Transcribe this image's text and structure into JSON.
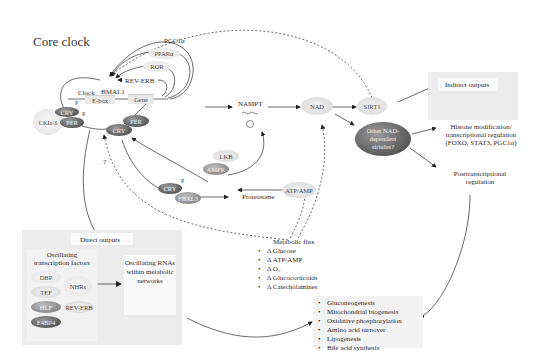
{
  "title": "Core clock",
  "core_clock": {
    "regulators": [
      "PGC1α",
      "PPARα",
      "ROR",
      "REV-ERB"
    ],
    "clock_label": "Clock",
    "bmal1_label": "BMAL1",
    "ebox_label": "E-box",
    "gene_label": "Gene",
    "ck_label": "CKIε/δ",
    "cry_label": "CRY",
    "per_label": "PER",
    "phospho_label": "P",
    "question_label": "?"
  },
  "metabolic_nodes": {
    "nampt_label": "NAMPT",
    "plus_label": "+",
    "nad_label": "NAD",
    "sirt1_label": "SIRT1",
    "other_sirtuins_label": "Other NAD-dependent sirtuins?",
    "lkb_label": "LKB",
    "ampk_label": "AMPK",
    "atp_amp_label": "ATP/AMP",
    "fbxl3_label": "FBXL3",
    "proteasome_label": "Proteasome"
  },
  "indirect_outputs": {
    "title": "Indirect outputs",
    "histone_label": "Histone modification/ transcriptional regulation (FOXO, STAT3, PGC1α)",
    "posttranscriptional_label": "Posttranscriptional regulation"
  },
  "metabolic_flux": {
    "title": "Metabolic flux",
    "items": [
      "Δ Glucose",
      "Δ ATP/AMP",
      "Δ O₂",
      "Δ Glucocorticoids",
      "Δ Catecholamines"
    ]
  },
  "direct_outputs": {
    "title": "Direct outputs",
    "tf_title": "Oscillating transcription factors",
    "tfs": [
      "DBP",
      "TEF",
      "HLF",
      "E4BP4"
    ],
    "nhrs_label": "NHRs",
    "reverb_label": "REV-ERB",
    "rna_label": "Oscillating RNAs within metabolic networks"
  },
  "processes": {
    "items": [
      "Gluconeogenesis",
      "Mitochondrial biogenesis",
      "Oxidative phosphorylation",
      "Amino acid turnover",
      "Lipogenesis",
      "Bile acid synthesis"
    ]
  }
}
